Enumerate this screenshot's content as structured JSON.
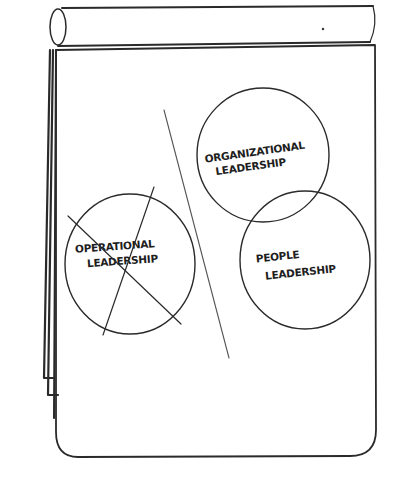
{
  "diagram": {
    "type": "flipchart-sketch",
    "ink_color": "#2a2a2a",
    "background_color": "#ffffff",
    "circles": [
      {
        "id": "organizational",
        "label_line1": "ORGANIZATIONAL",
        "label_line2": "LEADERSHIP",
        "crossed_out": false
      },
      {
        "id": "people",
        "label_line1": "PEOPLE",
        "label_line2": "LEADERSHIP",
        "crossed_out": false
      },
      {
        "id": "operational",
        "label_line1": "OPERATIONAL",
        "label_line2": "LEADERSHIP",
        "crossed_out": true
      }
    ],
    "divider": "diagonal-line"
  }
}
